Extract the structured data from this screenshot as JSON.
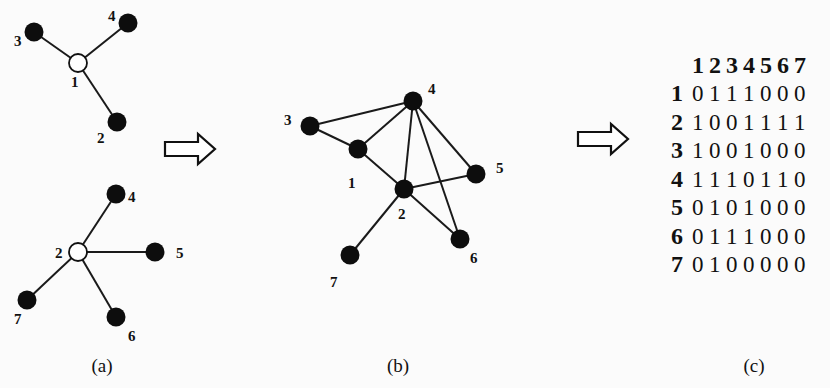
{
  "panels": {
    "a": {
      "caption": "(a)",
      "star1": {
        "center": {
          "id": "1",
          "label": "1",
          "x": 78,
          "y": 63,
          "lx": 71,
          "ly": 87,
          "hollow": true
        },
        "leaves": [
          {
            "id": "3",
            "label": "3",
            "x": 34,
            "y": 32,
            "lx": 14,
            "ly": 46
          },
          {
            "id": "4",
            "label": "4",
            "x": 128,
            "y": 23,
            "lx": 108,
            "ly": 21
          },
          {
            "id": "2",
            "label": "2",
            "x": 117,
            "y": 122,
            "lx": 97,
            "ly": 143
          }
        ]
      },
      "star2": {
        "center": {
          "id": "2",
          "label": "2",
          "x": 78,
          "y": 252,
          "lx": 55,
          "ly": 258,
          "hollow": true
        },
        "leaves": [
          {
            "id": "4",
            "label": "4",
            "x": 116,
            "y": 194,
            "lx": 128,
            "ly": 202
          },
          {
            "id": "5",
            "label": "5",
            "x": 155,
            "y": 252,
            "lx": 176,
            "ly": 258
          },
          {
            "id": "7",
            "label": "7",
            "x": 27,
            "y": 300,
            "lx": 14,
            "ly": 324
          },
          {
            "id": "6",
            "label": "6",
            "x": 116,
            "y": 317,
            "lx": 128,
            "ly": 341
          }
        ]
      }
    },
    "b": {
      "caption": "(b)",
      "nodes": [
        {
          "id": "1",
          "label": "1",
          "x": 358,
          "y": 149,
          "lx": 348,
          "ly": 188
        },
        {
          "id": "2",
          "label": "2",
          "x": 404,
          "y": 189,
          "lx": 398,
          "ly": 219
        },
        {
          "id": "3",
          "label": "3",
          "x": 310,
          "y": 126,
          "lx": 284,
          "ly": 125
        },
        {
          "id": "4",
          "label": "4",
          "x": 413,
          "y": 101,
          "lx": 428,
          "ly": 94
        },
        {
          "id": "5",
          "label": "5",
          "x": 476,
          "y": 174,
          "lx": 496,
          "ly": 173
        },
        {
          "id": "6",
          "label": "6",
          "x": 460,
          "y": 239,
          "lx": 470,
          "ly": 263
        },
        {
          "id": "7",
          "label": "7",
          "x": 350,
          "y": 255,
          "lx": 330,
          "ly": 287
        }
      ],
      "edges": [
        [
          "3",
          "4"
        ],
        [
          "3",
          "1"
        ],
        [
          "1",
          "4"
        ],
        [
          "1",
          "2"
        ],
        [
          "2",
          "4"
        ],
        [
          "4",
          "5"
        ],
        [
          "4",
          "6"
        ],
        [
          "2",
          "5"
        ],
        [
          "2",
          "6"
        ],
        [
          "2",
          "7"
        ]
      ]
    },
    "c": {
      "caption": "(c)",
      "matrix": {
        "col_headers": [
          "1",
          "2",
          "3",
          "4",
          "5",
          "6",
          "7"
        ],
        "rows": [
          {
            "label": "1",
            "values": [
              "0",
              "1",
              "1",
              "1",
              "0",
              "0",
              "0"
            ]
          },
          {
            "label": "2",
            "values": [
              "1",
              "0",
              "0",
              "1",
              "1",
              "1",
              "1"
            ]
          },
          {
            "label": "3",
            "values": [
              "1",
              "0",
              "0",
              "1",
              "0",
              "0",
              "0"
            ]
          },
          {
            "label": "4",
            "values": [
              "1",
              "1",
              "1",
              "0",
              "1",
              "1",
              "0"
            ]
          },
          {
            "label": "5",
            "values": [
              "0",
              "1",
              "0",
              "1",
              "0",
              "0",
              "0"
            ]
          },
          {
            "label": "6",
            "values": [
              "0",
              "1",
              "1",
              "1",
              "0",
              "0",
              "0"
            ]
          },
          {
            "label": "7",
            "values": [
              "0",
              "1",
              "0",
              "0",
              "0",
              "0",
              "0"
            ]
          }
        ]
      }
    }
  },
  "arrows": [
    {
      "name": "arrow-a-to-b",
      "x": 165,
      "y": 149
    },
    {
      "name": "arrow-b-to-c",
      "x": 578,
      "y": 139
    }
  ]
}
